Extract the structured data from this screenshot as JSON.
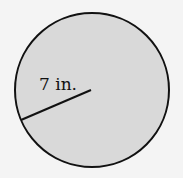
{
  "diagram": {
    "shape": "circle",
    "radius_label": "7 in.",
    "fill_color": "#d9d9d9",
    "stroke_color": "#111111",
    "background_color": "#f4f4f4"
  }
}
